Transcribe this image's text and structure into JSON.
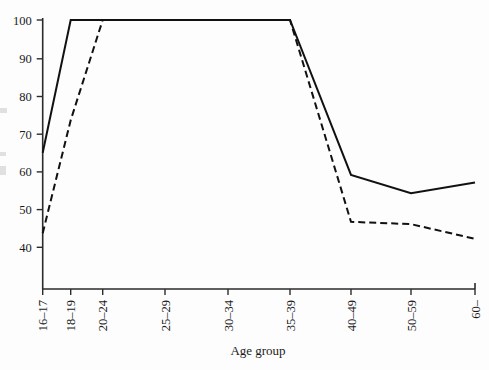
{
  "figure": {
    "background_color": "#fdfdfd",
    "ink_color": "#111111"
  },
  "axes": {
    "x_title": "Age group",
    "y_title": "",
    "y_ticks": [
      "40",
      "50",
      "60",
      "70",
      "80",
      "90",
      "100"
    ],
    "x_ticks": [
      "16–17",
      "18–19",
      "20–24",
      "25–29",
      "30–34",
      "35–39",
      "40–49",
      "50–59",
      "60–"
    ]
  },
  "chart_data": {
    "type": "line",
    "title": "",
    "subtitle": "",
    "xlabel": "Age group",
    "ylabel": "",
    "categories": [
      "16–17",
      "18–19",
      "20–24",
      "25–29",
      "30–34",
      "35–39",
      "40–49",
      "50–59",
      "60–"
    ],
    "series": [
      {
        "name": "solid-line",
        "style": "solid",
        "color": "#111111",
        "values": [
          64.9,
          100.0,
          100.0,
          100.0,
          100.0,
          100.0,
          59.0,
          54.2,
          57.0
        ]
      },
      {
        "name": "dashed-line",
        "style": "dashed",
        "color": "#111111",
        "values": [
          43.6,
          73.5,
          100.0,
          100.0,
          100.0,
          100.0,
          46.6,
          46.0,
          42.1
        ]
      }
    ],
    "ylim": [
      33,
      102
    ],
    "ytick_values": [
      40,
      50,
      60,
      70,
      80,
      90,
      100
    ],
    "grid": false,
    "legend": "none"
  },
  "geometry": {
    "plot_left": 42.7,
    "plot_right": 475.0,
    "axis_baseline_y": 289.0,
    "y_top_value": 100,
    "y_top_px": 20.0,
    "px_per_unit": 3.78,
    "x_tick_px": [
      42.7,
      70.7,
      102.7,
      165.0,
      228.0,
      290.0,
      351.0,
      411.0,
      475.0
    ],
    "y_tick_px": [
      247.3,
      209.6,
      171.9,
      134.2,
      96.5,
      58.8,
      20.0
    ]
  }
}
